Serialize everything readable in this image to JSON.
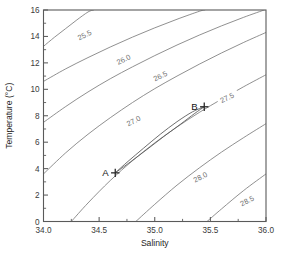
{
  "chart_data": {
    "type": "line",
    "title": "",
    "subtitle": "",
    "xlabel": "Salinity",
    "ylabel": "Temperature (°C)",
    "xlim": [
      34.0,
      36.0
    ],
    "ylim": [
      0,
      16
    ],
    "grid": false,
    "legend": "none",
    "x_ticks": [
      "34.0",
      "34.5",
      "35.0",
      "35.5",
      "36.0"
    ],
    "x_tick_values": [
      34.0,
      34.5,
      35.0,
      35.5,
      36.0
    ],
    "x_minor_tick_values": [
      34.25,
      34.75,
      35.25,
      35.75
    ],
    "y_ticks": [
      "0",
      "2",
      "4",
      "6",
      "8",
      "10",
      "12",
      "14",
      "16"
    ],
    "y_tick_values": [
      0,
      2,
      4,
      6,
      8,
      10,
      12,
      14,
      16
    ],
    "y_minor_tick_values": [
      1,
      3,
      5,
      7,
      9,
      11,
      13,
      15
    ],
    "contour_levels": [
      "25.5",
      "26.0",
      "26.5",
      "27.0",
      "27.5",
      "28.0",
      "28.5"
    ],
    "contours": [
      {
        "label": "25.5",
        "label_x": 34.38,
        "label_y": 14.1,
        "points": [
          [
            34.0,
            13.25
          ],
          [
            34.1,
            13.95
          ],
          [
            34.2,
            14.6
          ],
          [
            34.3,
            15.25
          ],
          [
            34.4,
            15.85
          ],
          [
            34.45,
            16.0
          ]
        ]
      },
      {
        "label": "26.0",
        "label_x": 34.73,
        "label_y": 12.25,
        "points": [
          [
            34.0,
            10.6
          ],
          [
            34.2,
            11.55
          ],
          [
            34.4,
            12.4
          ],
          [
            34.6,
            13.2
          ],
          [
            34.8,
            13.95
          ],
          [
            35.0,
            14.65
          ],
          [
            35.2,
            15.3
          ],
          [
            35.4,
            15.9
          ],
          [
            35.45,
            16.0
          ]
        ]
      },
      {
        "label": "26.5",
        "label_x": 35.06,
        "label_y": 11.0,
        "points": [
          [
            34.0,
            7.5
          ],
          [
            34.2,
            8.7
          ],
          [
            34.4,
            9.8
          ],
          [
            34.6,
            10.8
          ],
          [
            34.8,
            11.7
          ],
          [
            35.0,
            12.55
          ],
          [
            35.2,
            13.35
          ],
          [
            35.4,
            14.1
          ],
          [
            35.6,
            14.8
          ],
          [
            35.8,
            15.45
          ],
          [
            36.0,
            16.05
          ]
        ]
      },
      {
        "label": "27.0",
        "label_x": 34.82,
        "label_y": 7.6,
        "points": [
          [
            34.0,
            3.6
          ],
          [
            34.2,
            5.2
          ],
          [
            34.4,
            6.6
          ],
          [
            34.6,
            7.85
          ],
          [
            34.8,
            9.0
          ],
          [
            35.0,
            10.05
          ],
          [
            35.2,
            11.0
          ],
          [
            35.4,
            11.9
          ],
          [
            35.6,
            12.75
          ],
          [
            35.8,
            13.55
          ],
          [
            36.0,
            14.3
          ]
        ]
      },
      {
        "label": "27.5",
        "label_x": 35.66,
        "label_y": 9.35,
        "points": [
          [
            34.25,
            0.0
          ],
          [
            34.4,
            1.4
          ],
          [
            34.6,
            3.1
          ],
          [
            34.8,
            4.6
          ],
          [
            35.0,
            5.95
          ],
          [
            35.2,
            7.15
          ],
          [
            35.4,
            8.25
          ],
          [
            35.6,
            9.25
          ],
          [
            35.8,
            10.2
          ],
          [
            36.0,
            11.1
          ]
        ]
      },
      {
        "label": "28.0",
        "label_x": 35.42,
        "label_y": 3.35,
        "points": [
          [
            34.83,
            0.0
          ],
          [
            35.0,
            1.3
          ],
          [
            35.2,
            2.75
          ],
          [
            35.4,
            4.05
          ],
          [
            35.6,
            5.25
          ],
          [
            35.8,
            6.35
          ],
          [
            36.0,
            7.4
          ]
        ]
      },
      {
        "label": "28.5",
        "label_x": 35.84,
        "label_y": 1.55,
        "points": [
          [
            35.47,
            0.0
          ],
          [
            35.6,
            0.95
          ],
          [
            35.8,
            2.35
          ],
          [
            36.0,
            3.6
          ]
        ]
      }
    ],
    "markers": [
      {
        "label": "A",
        "x": 34.645,
        "y": 3.68,
        "style": "plus",
        "label_side": "left"
      },
      {
        "label": "B",
        "x": 35.445,
        "y": 8.68,
        "style": "plus",
        "label_side": "left"
      }
    ],
    "mixing_loop": {
      "description": "narrow elongated loop connecting marker A to marker B",
      "upper_path": [
        [
          34.645,
          3.68
        ],
        [
          34.76,
          4.55
        ],
        [
          34.9,
          5.55
        ],
        [
          35.05,
          6.6
        ],
        [
          35.2,
          7.55
        ],
        [
          35.34,
          8.3
        ],
        [
          35.445,
          8.68
        ]
      ],
      "lower_path": [
        [
          34.645,
          3.68
        ],
        [
          34.78,
          4.5
        ],
        [
          34.93,
          5.45
        ],
        [
          35.08,
          6.42
        ],
        [
          35.23,
          7.35
        ],
        [
          35.36,
          8.18
        ],
        [
          35.445,
          8.68
        ]
      ]
    },
    "colors": {
      "contour": "#7c7c7c",
      "axis": "#5a5a5a",
      "marker": "#2a2a2a",
      "text": "#262626",
      "background": "#ffffff"
    }
  }
}
